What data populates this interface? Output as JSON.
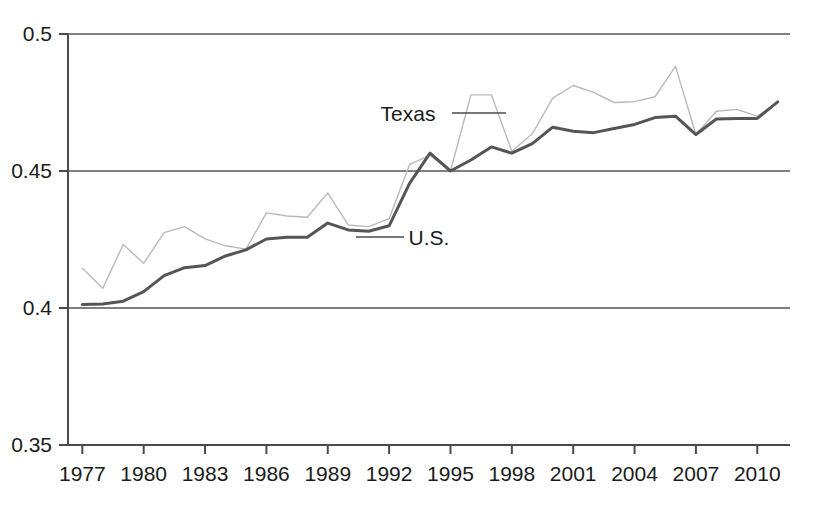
{
  "chart_data": {
    "type": "line",
    "title": "",
    "subtitle": "",
    "xlabel": "",
    "ylabel": "",
    "xlim": [
      1976.3,
      2011.6
    ],
    "ylim": [
      0.35,
      0.5
    ],
    "grid": "horizontal",
    "legend_position": "inline-annotations",
    "y_ticks": [
      0.35,
      0.4,
      0.45,
      0.5
    ],
    "y_tick_labels": [
      "0.35",
      "0.4",
      "0.45",
      "0.5"
    ],
    "x_ticks": [
      1977,
      1980,
      1983,
      1986,
      1989,
      1992,
      1995,
      1998,
      2001,
      2004,
      2007,
      2010
    ],
    "x_tick_labels": [
      "1977",
      "1980",
      "1983",
      "1986",
      "1989",
      "1992",
      "1995",
      "1998",
      "2001",
      "2004",
      "2007",
      "2010"
    ],
    "x": [
      1977,
      1978,
      1979,
      1980,
      1981,
      1982,
      1983,
      1984,
      1985,
      1986,
      1987,
      1988,
      1989,
      1990,
      1991,
      1992,
      1993,
      1994,
      1995,
      1996,
      1997,
      1998,
      1999,
      2000,
      2001,
      2002,
      2003,
      2004,
      2005,
      2006,
      2007,
      2008,
      2009,
      2010,
      2011
    ],
    "series": [
      {
        "name": "Texas",
        "color": "#b9b9b9",
        "line_width": 1.4,
        "values": [
          0.4145,
          0.4072,
          0.4232,
          0.4163,
          0.4275,
          0.4297,
          0.4252,
          0.4227,
          0.4215,
          0.4347,
          0.4336,
          0.4331,
          0.442,
          0.4303,
          0.4297,
          0.4326,
          0.4524,
          0.4557,
          0.45,
          0.4778,
          0.4778,
          0.4572,
          0.4636,
          0.4766,
          0.4812,
          0.4787,
          0.475,
          0.4753,
          0.4771,
          0.4882,
          0.4633,
          0.4718,
          0.4725,
          0.47,
          0.4752
        ]
      },
      {
        "name": "U.S.",
        "color": "#555555",
        "line_width": 3.0,
        "values": [
          0.4013,
          0.4015,
          0.4025,
          0.406,
          0.4118,
          0.4147,
          0.4155,
          0.419,
          0.4212,
          0.4252,
          0.4258,
          0.4258,
          0.431,
          0.4285,
          0.428,
          0.43,
          0.4455,
          0.4565,
          0.45,
          0.454,
          0.4588,
          0.4565,
          0.46,
          0.466,
          0.4645,
          0.464,
          0.4655,
          0.467,
          0.4695,
          0.47,
          0.4633,
          0.469,
          0.4692,
          0.4692,
          0.4752
        ]
      }
    ],
    "annotations": [
      {
        "text": "Texas",
        "series": "Texas",
        "label_x": 408,
        "label_y": 121,
        "leader_from_x": 452,
        "leader_from_y": 113,
        "leader_to_x": 506,
        "leader_to_y": 113
      },
      {
        "text": "U.S.",
        "series": "U.S.",
        "label_x": 429,
        "label_y": 245,
        "leader_from_x": 356,
        "leader_from_y": 237,
        "leader_to_x": 404,
        "leader_to_y": 237
      }
    ]
  },
  "axes": {
    "axis_color": "#4a4a4a",
    "grid_color": "#555555",
    "plot_left": 68,
    "plot_right": 790,
    "plot_top": 34,
    "plot_bottom": 445
  }
}
